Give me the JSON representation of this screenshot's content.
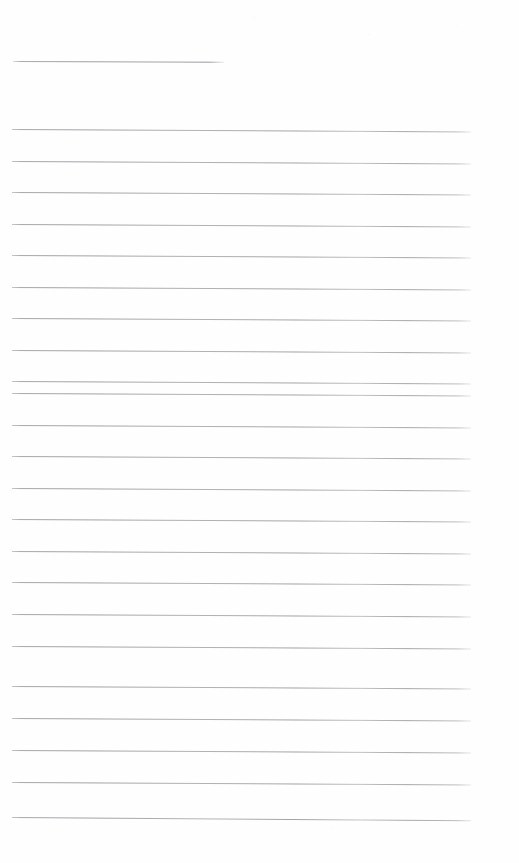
{
  "document": {
    "kind": "scanned-blank-ruled-page",
    "page_label": "",
    "body_text": "",
    "background_color": "#fefefe",
    "rule_color": "#9a9ea2",
    "page_width": 519,
    "page_height": 863
  },
  "header_rule": {
    "name": "title-underline-rule",
    "x": 13,
    "y": 61,
    "width": 211,
    "slope_deg": 0.22
  },
  "ruled_lines": [
    {
      "index": 1,
      "x": 12,
      "y": 129,
      "width": 459,
      "slope_deg": 0.3
    },
    {
      "index": 2,
      "x": 12,
      "y": 161,
      "width": 459,
      "slope_deg": 0.3
    },
    {
      "index": 3,
      "x": 12,
      "y": 192,
      "width": 459,
      "slope_deg": 0.3
    },
    {
      "index": 4,
      "x": 12,
      "y": 224,
      "width": 459,
      "slope_deg": 0.3
    },
    {
      "index": 5,
      "x": 12,
      "y": 255,
      "width": 459,
      "slope_deg": 0.3
    },
    {
      "index": 6,
      "x": 12,
      "y": 287,
      "width": 459,
      "slope_deg": 0.3
    },
    {
      "index": 7,
      "x": 12,
      "y": 318,
      "width": 459,
      "slope_deg": 0.3
    },
    {
      "index": 8,
      "x": 12,
      "y": 350,
      "width": 459,
      "slope_deg": 0.3
    },
    {
      "index": 9,
      "x": 12,
      "y": 381,
      "width": 459,
      "slope_deg": 0.3
    },
    {
      "index": 10,
      "x": 12,
      "y": 393,
      "width": 459,
      "slope_deg": 0.3
    },
    {
      "index": 11,
      "x": 12,
      "y": 425,
      "width": 459,
      "slope_deg": 0.3
    },
    {
      "index": 12,
      "x": 12,
      "y": 456,
      "width": 459,
      "slope_deg": 0.3
    },
    {
      "index": 13,
      "x": 12,
      "y": 488,
      "width": 459,
      "slope_deg": 0.3
    },
    {
      "index": 14,
      "x": 12,
      "y": 519,
      "width": 459,
      "slope_deg": 0.3
    },
    {
      "index": 15,
      "x": 12,
      "y": 551,
      "width": 459,
      "slope_deg": 0.3
    },
    {
      "index": 16,
      "x": 12,
      "y": 582,
      "width": 459,
      "slope_deg": 0.3
    },
    {
      "index": 17,
      "x": 12,
      "y": 614,
      "width": 459,
      "slope_deg": 0.3
    },
    {
      "index": 18,
      "x": 12,
      "y": 646,
      "width": 459,
      "slope_deg": 0.3
    },
    {
      "index": 19,
      "x": 12,
      "y": 686,
      "width": 459,
      "slope_deg": 0.3
    },
    {
      "index": 20,
      "x": 12,
      "y": 718,
      "width": 459,
      "slope_deg": 0.3
    },
    {
      "index": 21,
      "x": 12,
      "y": 750,
      "width": 459,
      "slope_deg": 0.3
    },
    {
      "index": 22,
      "x": 12,
      "y": 782,
      "width": 459,
      "slope_deg": 0.3
    },
    {
      "index": 23,
      "x": 12,
      "y": 817,
      "width": 459,
      "slope_deg": 0.4
    }
  ]
}
